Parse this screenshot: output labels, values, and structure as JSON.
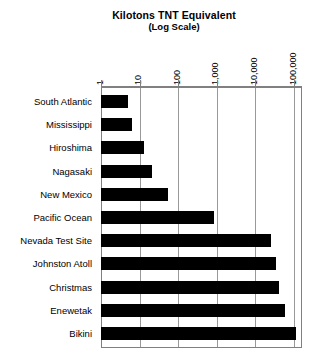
{
  "chart_data": {
    "type": "bar",
    "orientation": "horizontal",
    "title": "Kilotons TNT Equivalent",
    "subtitle": "(Log Scale)",
    "xlabel": "",
    "ylabel": "",
    "scale": "log",
    "grid": true,
    "legend": "none",
    "xlim": [
      1,
      100000
    ],
    "xticks": [
      1,
      10,
      100,
      1000,
      10000,
      100000
    ],
    "xtick_labels": [
      "1",
      "10",
      "100",
      "1,000",
      "10,000",
      "100,000"
    ],
    "categories": [
      "South Atlantic",
      "Mississippi",
      "Hiroshima",
      "Nagasaki",
      "New Mexico",
      "Pacific Ocean",
      "Nevada Test Site",
      "Johnston Atoll",
      "Christmas",
      "Enewetak",
      "Bikini"
    ],
    "values": [
      5,
      6.5,
      13,
      21,
      55,
      850,
      26000,
      35000,
      40000,
      60000,
      110000
    ],
    "bar_color": "#000000",
    "background_color": "#ffffff",
    "grid_color": "#999999"
  }
}
